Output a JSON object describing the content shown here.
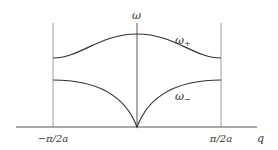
{
  "diagram": {
    "type": "dispersion-relation",
    "axes": {
      "y_label": "ω",
      "x_label": "q",
      "x_tick_left": "−π/2a",
      "x_tick_right": "π/2a"
    },
    "branches": [
      {
        "name": "upper-branch",
        "label": "ω",
        "subscript": "+"
      },
      {
        "name": "lower-branch",
        "label": "ω",
        "subscript": "−"
      }
    ],
    "colors": {
      "curve": "#333333",
      "boundary": "#999999",
      "axis": "#555555"
    }
  }
}
